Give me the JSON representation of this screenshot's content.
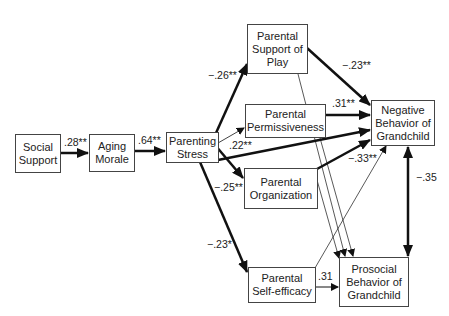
{
  "nodes": {
    "social_support": "Social Support",
    "aging_morale": "Aging Morale",
    "parenting_stress": "Parenting Stress",
    "support_of_play": "Parental Support of Play",
    "permissiveness": "Parental Permissiveness",
    "organization": "Parental Organization",
    "self_efficacy": "Parental Self-efficacy",
    "negative_behavior": "Negative Behavior of Grandchild",
    "prosocial_behavior": "Prosocial Behavior of Grandchild"
  },
  "paths": {
    "social_to_morale": ".28**",
    "morale_to_stress": ".64**",
    "stress_to_play": "−.26**",
    "stress_to_negative": ".22**",
    "stress_to_organization": "−.25**",
    "stress_to_selfefficacy": "−.23*",
    "play_to_negative": "−.23**",
    "permissiveness_to_negative": ".31**",
    "organization_to_negative": "−.33**",
    "selfefficacy_to_prosocial": ".31",
    "negative_prosocial_cov": "−.35"
  }
}
